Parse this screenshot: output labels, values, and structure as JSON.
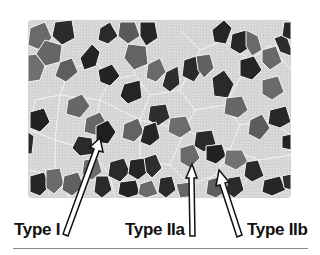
{
  "figure": {
    "colors": {
      "background": "#ffffff",
      "type_I_fiber": "#262626",
      "type_IIa_fiber": "#6e6e6e",
      "type_IIb_fiber": "#d4d4d4",
      "cell_border": "#f4f4f4",
      "arrow_fill": "#ffffff",
      "arrow_outline": "#111111",
      "rule": "#8a8a8a"
    },
    "labels": [
      {
        "id": "type-i",
        "text": "Type I"
      },
      {
        "id": "type-iia",
        "text": "Type IIa"
      },
      {
        "id": "type-iib",
        "text": "Type IIb"
      }
    ]
  }
}
